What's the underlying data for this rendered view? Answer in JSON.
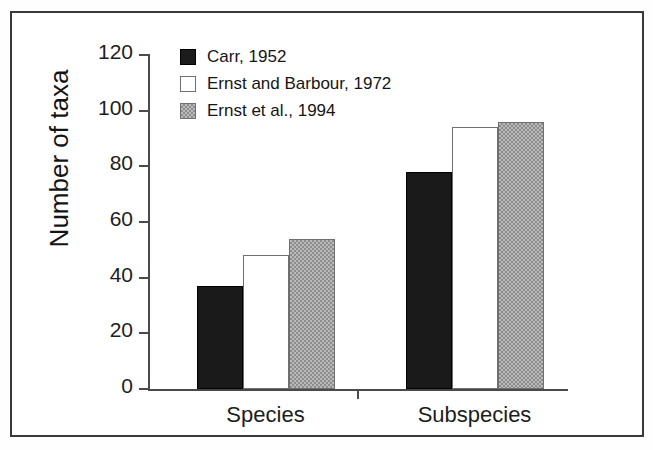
{
  "chart_data": {
    "type": "bar",
    "title": "",
    "xlabel": "",
    "ylabel": "Number of taxa",
    "categories": [
      "Species",
      "Subspecies"
    ],
    "series": [
      {
        "name": "Carr, 1952",
        "color": "#1a1a1a",
        "fill": "solid-black",
        "values": [
          37,
          78
        ]
      },
      {
        "name": "Ernst and Barbour, 1972",
        "color": "#ffffff",
        "fill": "open-white",
        "values": [
          48,
          94
        ]
      },
      {
        "name": "Ernst et al., 1994",
        "color": "#b9b9b9",
        "fill": "gray-stipple",
        "values": [
          54,
          96
        ]
      }
    ],
    "ylim": [
      0,
      120
    ],
    "yticks": [
      0,
      20,
      40,
      60,
      80,
      100,
      120
    ],
    "ytick_labels": [
      "0",
      "20",
      "40",
      "60",
      "80",
      "100",
      "120"
    ],
    "grid": false,
    "legend_position": "top-left-inside"
  },
  "axis": {
    "y_title": "Number of taxa"
  },
  "legend": {
    "items": [
      {
        "label": "Carr, 1952"
      },
      {
        "label": "Ernst and Barbour, 1972"
      },
      {
        "label": "Ernst et al., 1994"
      }
    ]
  }
}
